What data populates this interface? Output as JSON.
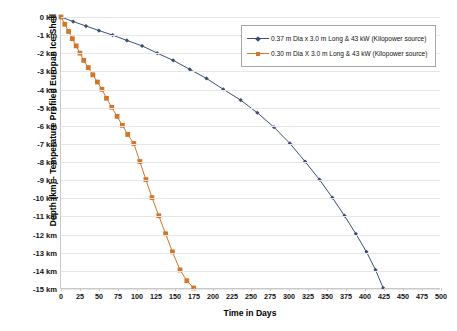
{
  "chart_data": {
    "type": "line",
    "title": "",
    "xlabel": "Time in Days",
    "ylabel": "Depth (km) - Temperature Profiled Europan Ice Shell",
    "xlim": [
      0,
      500
    ],
    "ylim": [
      -15,
      0
    ],
    "grid": "horizontal",
    "legend_position": "top-right",
    "xticks": [
      0,
      25,
      50,
      75,
      100,
      125,
      150,
      175,
      200,
      225,
      250,
      275,
      300,
      325,
      350,
      375,
      400,
      425,
      450,
      475,
      500
    ],
    "xtick_labels": [
      "0",
      "25",
      "50",
      "75",
      "100",
      "125",
      "150",
      "175",
      "200",
      "225",
      "250",
      "275",
      "300",
      "325",
      "350",
      "375",
      "400",
      "425",
      "450",
      "475",
      "500"
    ],
    "yticks": [
      0,
      -1,
      -2,
      -3,
      -4,
      -5,
      -6,
      -7,
      -8,
      -9,
      -10,
      -11,
      -12,
      -13,
      -14,
      -15
    ],
    "ytick_labels": [
      "0 km",
      "-1 km",
      "-2 km",
      "-3 km",
      "-4 km",
      "-5 km",
      "-6 km",
      "-7 km",
      "-8 km",
      "-9 km",
      "-10 km",
      "-11 km",
      "-12 km",
      "-13 km",
      "-14 km",
      "-15 km"
    ],
    "series": [
      {
        "name": "0.37 m Dia x 3.0 m Long & 43 kW (Kilopower source)",
        "color": "#3A4E78",
        "marker": "diamond",
        "x": [
          0,
          16,
          33,
          50,
          68,
          87,
          107,
          127,
          148,
          170,
          192,
          214,
          237,
          259,
          281,
          302,
          322,
          341,
          358,
          374,
          389,
          403,
          415,
          425
        ],
        "y": [
          0,
          -0.25,
          -0.5,
          -0.75,
          -1.0,
          -1.3,
          -1.6,
          -2.0,
          -2.4,
          -2.9,
          -3.4,
          -4.0,
          -4.6,
          -5.3,
          -6.1,
          -7.0,
          -8.0,
          -9.0,
          -10.0,
          -11.0,
          -12.0,
          -13.0,
          -14.0,
          -15.0
        ]
      },
      {
        "name": "0.30 m Dia X 3.0 m Long & 43 kW (Kilopower source)",
        "color": "#D2762B",
        "marker": "square",
        "x": [
          0,
          5,
          10,
          15,
          20,
          25,
          30,
          36,
          42,
          48,
          54,
          60,
          67,
          74,
          81,
          88,
          96,
          104,
          112,
          120,
          129,
          138,
          147,
          157,
          166,
          175
        ],
        "y": [
          0,
          -0.4,
          -0.8,
          -1.2,
          -1.6,
          -2.0,
          -2.4,
          -2.8,
          -3.2,
          -3.6,
          -4.0,
          -4.5,
          -5.0,
          -5.5,
          -6.0,
          -6.5,
          -7.0,
          -8.0,
          -9.0,
          -10.0,
          -11.0,
          -12.0,
          -13.0,
          -14.0,
          -14.6,
          -15.0
        ]
      }
    ]
  },
  "legend": {
    "items": [
      {
        "label": "0.37 m Dia x 3.0 m Long & 43 kW (Kilopower source)",
        "color": "#3A4E78"
      },
      {
        "label": "0.30 m Dia X 3.0 m Long & 43 kW (Kilopower source)",
        "color": "#D2762B"
      }
    ]
  }
}
